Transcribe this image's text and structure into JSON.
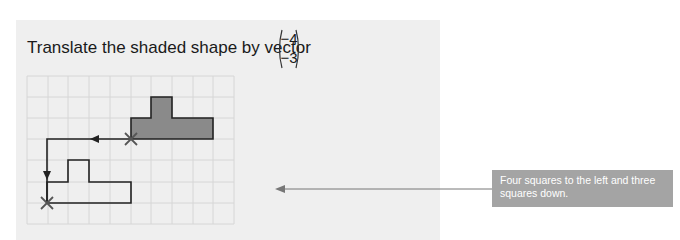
{
  "question": {
    "text": "Translate the shaded shape by vector",
    "vector": {
      "x": "−4",
      "y": "−3"
    }
  },
  "grid": {
    "cols": 10,
    "rows": 7,
    "cell_px": 20.8,
    "origin": [
      27,
      76
    ]
  },
  "shapes": {
    "original": {
      "label": "shaded shape",
      "fill": "#8a8a8a",
      "points": "131,139 131,118 151,118 151,97 172,97 172,118 213,118 213,139"
    },
    "image": {
      "label": "translated shape",
      "fill": "none",
      "points": "47,203 47,182 68,182 68,160 89,160 89,182 131,182 131,203"
    }
  },
  "path": {
    "points": "131,139 47,139 47,203"
  },
  "callout": {
    "text": "Four squares to the left and three squares down.",
    "background": "#a4a4a4"
  },
  "colors": {
    "panel": "#efefef",
    "grid": "#d8d8d8",
    "stroke": "#222222"
  }
}
